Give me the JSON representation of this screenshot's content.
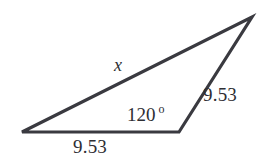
{
  "figure": {
    "name": "obtuse-triangle-diagram",
    "type": "geometry-diagram",
    "background_color": "#ffffff",
    "stroke_color": "#3a3a40",
    "text_color": "#2e2e33"
  },
  "geometry": {
    "vertices": {
      "left": {
        "x": 22,
        "y": 132
      },
      "bottom_right": {
        "x": 179,
        "y": 132
      },
      "apex": {
        "x": 252,
        "y": 17
      }
    },
    "stroke_width": 3.2
  },
  "labels": {
    "bottom_side": "9.53",
    "right_side": "9.53",
    "unknown_side": "x",
    "angle_value": "120",
    "angle_degree_symbol": "o"
  }
}
